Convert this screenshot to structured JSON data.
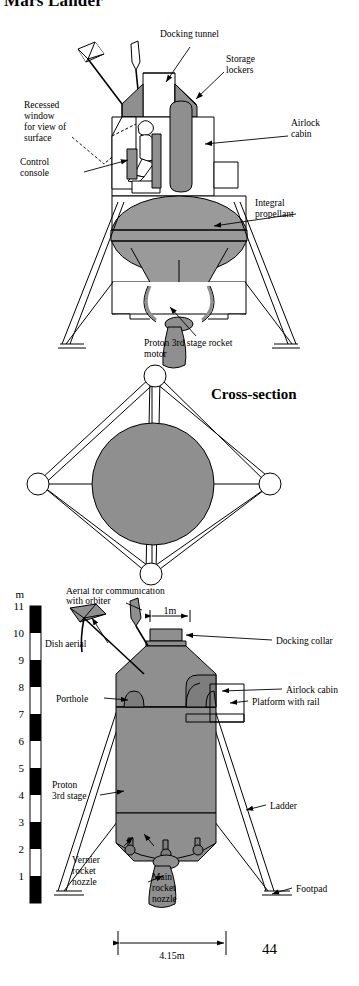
{
  "document": {
    "title": "Mars Lander",
    "page_number": "44"
  },
  "colors": {
    "body_grey": "#8f8f8f",
    "tank_grey": "#9a9a9a",
    "dark_grey": "#7d7d7d",
    "outline": "#000000",
    "white": "#ffffff",
    "page_background": "#ffffff"
  },
  "figures": [
    {
      "id": "lander-cutaway",
      "caption": "",
      "labels": [
        {
          "key": "docking_tunnel",
          "text": "Docking tunnel"
        },
        {
          "key": "storage_lockers",
          "text": "Storage\nlockers",
          "line1": "Storage",
          "line2": "lockers"
        },
        {
          "key": "airlock_cabin",
          "text": "Airlock\ncabin",
          "line1": "Airlock",
          "line2": "cabin"
        },
        {
          "key": "recessed_window",
          "text": "Recessed window for view of surface",
          "line1": "Recessed",
          "line2": "window",
          "line3": "for view of",
          "line4": "surface"
        },
        {
          "key": "control_console",
          "text": "Control console",
          "line1": "Control",
          "line2": "console"
        },
        {
          "key": "integral_propellant",
          "text": "Integral propellant",
          "line1": "Integral",
          "line2": "propellant"
        },
        {
          "key": "proton_motor",
          "text": "Proton 3rd stage rocket motor",
          "line1": "Proton 3rd stage rocket",
          "line2": "motor"
        }
      ]
    },
    {
      "id": "cross-section",
      "caption": "Cross-section",
      "labels": []
    },
    {
      "id": "scale-elevation",
      "caption": "",
      "labels": [
        {
          "key": "aerial_comm",
          "text": "Aerial for communication with orbiter",
          "line1": "Aerial for communication",
          "line2": "with orbiter"
        },
        {
          "key": "dish_aerial",
          "text": "Dish aerial"
        },
        {
          "key": "docking_collar",
          "text": "Docking collar"
        },
        {
          "key": "airlock_cabin",
          "text": "Airlock cabin"
        },
        {
          "key": "porthole",
          "text": "Porthole"
        },
        {
          "key": "platform_rail",
          "text": "Platform with rail"
        },
        {
          "key": "proton_3rd_stage",
          "text": "Proton 3rd stage",
          "line1": "Proton",
          "line2": "3rd stage"
        },
        {
          "key": "ladder",
          "text": "Ladder"
        },
        {
          "key": "vernier_nozzle",
          "text": "Vernier rocket nozzle",
          "line1": "Vernier",
          "line2": "rocket",
          "line3": "nozzle"
        },
        {
          "key": "main_nozzle",
          "text": "Main rocket nozzle",
          "line1": "Main",
          "line2": "rocket",
          "line3": "nozzle"
        },
        {
          "key": "footpad",
          "text": "Footpad"
        }
      ]
    }
  ],
  "scale": {
    "unit_label": "m",
    "ticks": [
      "11",
      "10",
      "9",
      "8",
      "7",
      "6",
      "5",
      "4",
      "3",
      "2",
      "1"
    ],
    "max": 11,
    "min": 0,
    "band_pattern": "alternating-black-white-per-metre"
  },
  "dimensions": [
    {
      "key": "collar_width",
      "value": "1m",
      "orientation": "horizontal"
    },
    {
      "key": "base_width",
      "value": "4.15m",
      "orientation": "horizontal"
    }
  ]
}
